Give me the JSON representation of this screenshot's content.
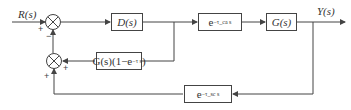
{
  "diagram": {
    "type": "block-diagram",
    "input_label": "R(s)",
    "output_label": "Y(s)",
    "blocks": {
      "controller": "D(s)",
      "forward_delay": "e",
      "forward_delay_exp": "−τ_ca s",
      "plant": "G(s)",
      "predictor": "G(s)(1−e",
      "predictor_exp": "−τ s",
      "predictor_close": ")",
      "feedback_delay": "e",
      "feedback_delay_exp": "−τ_sc s"
    },
    "summing_junctions": [
      {
        "id": "sum1",
        "signs": [
          "+",
          "−"
        ]
      },
      {
        "id": "sum2",
        "signs": [
          "+",
          "+"
        ]
      }
    ],
    "signs": {
      "sum1_input": "+",
      "sum1_feedback": "−",
      "sum2_predictor": "+",
      "sum2_feedback": "+"
    },
    "colors": {
      "line": "#444444",
      "text": "#333333"
    }
  }
}
